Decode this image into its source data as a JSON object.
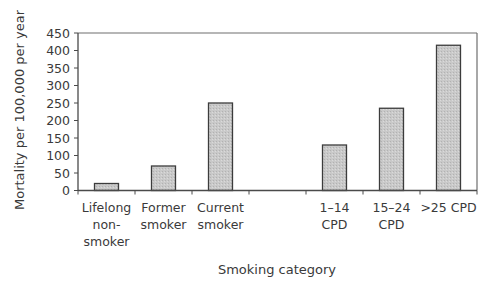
{
  "chart_data": {
    "type": "bar",
    "title": "",
    "xlabel": "Smoking category",
    "ylabel": "Mortality per 100,000 per year",
    "ylim": [
      0,
      450
    ],
    "yticks": [
      0,
      50,
      100,
      150,
      200,
      250,
      300,
      350,
      400,
      450
    ],
    "grid": false,
    "legend": null,
    "categories": [
      [
        "Lifelong",
        "non-",
        "smoker"
      ],
      [
        "Former",
        "smoker"
      ],
      [
        "Current",
        "smoker"
      ],
      [],
      [
        "1–14",
        "CPD"
      ],
      [
        "15–24",
        "CPD"
      ],
      [
        ">25 CPD"
      ]
    ],
    "category_names": [
      "Lifelong non-smoker",
      "Former smoker",
      "Current smoker",
      "",
      "1–14 CPD",
      "15–24 CPD",
      ">25 CPD"
    ],
    "values": [
      20,
      70,
      250,
      null,
      130,
      235,
      415
    ],
    "colors": {
      "bar_fill": "#c4c4c4",
      "bar_stroke": "#3c3c3c",
      "axis": "#4a4a4a",
      "frame": "#6e6e6e"
    }
  }
}
